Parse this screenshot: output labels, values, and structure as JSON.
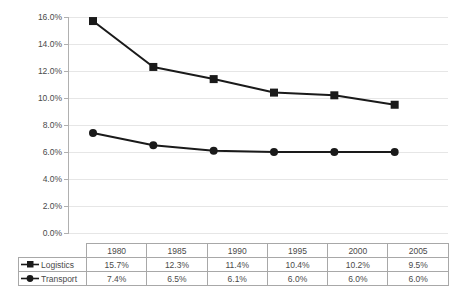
{
  "chart_data": {
    "type": "line",
    "title": "",
    "subtitle": "",
    "xlabel": "",
    "ylabel": "",
    "categories": [
      "1980",
      "1985",
      "1990",
      "1995",
      "2000",
      "2005"
    ],
    "series": [
      {
        "name": "Logistics",
        "marker": "square",
        "color": "#1a1a1a",
        "values": [
          15.7,
          12.3,
          11.4,
          10.4,
          10.2,
          9.5
        ],
        "labels": [
          "15.7%",
          "12.3%",
          "11.4%",
          "10.4%",
          "10.2%",
          "9.5%"
        ]
      },
      {
        "name": "Transport",
        "marker": "circle",
        "color": "#1a1a1a",
        "values": [
          7.4,
          6.5,
          6.1,
          6.0,
          6.0,
          6.0
        ],
        "labels": [
          "7.4%",
          "6.5%",
          "6.1%",
          "6.0%",
          "6.0%",
          "6.0%"
        ]
      }
    ],
    "ylim": [
      0.0,
      16.0
    ],
    "ytick_values": [
      0.0,
      2.0,
      4.0,
      6.0,
      8.0,
      10.0,
      12.0,
      14.0,
      16.0
    ],
    "ytick_labels": [
      "0.0%",
      "2.0%",
      "4.0%",
      "6.0%",
      "8.0%",
      "10.0%",
      "12.0%",
      "14.0%",
      "16.0%"
    ],
    "grid": true,
    "grid_axis": "y",
    "legend_position": "data-table-row-labels"
  },
  "table": {
    "corner_label": "",
    "column_headers": [
      "1980",
      "1985",
      "1990",
      "1995",
      "2000",
      "2005"
    ],
    "rows": [
      {
        "label": "Logistics",
        "marker": "square",
        "cells": [
          "15.7%",
          "12.3%",
          "11.4%",
          "10.4%",
          "10.2%",
          "9.5%"
        ]
      },
      {
        "label": "Transport",
        "marker": "circle",
        "cells": [
          "7.4%",
          "6.5%",
          "6.1%",
          "6.0%",
          "6.0%",
          "6.0%"
        ]
      }
    ]
  },
  "style": {
    "series_color": "#1a1a1a",
    "grid_color": "#e6e6e6",
    "axis_color": "#b0b0b0",
    "table_border_color": "#a8a8a8",
    "text_color": "#4a4a4a",
    "background": "#ffffff"
  }
}
